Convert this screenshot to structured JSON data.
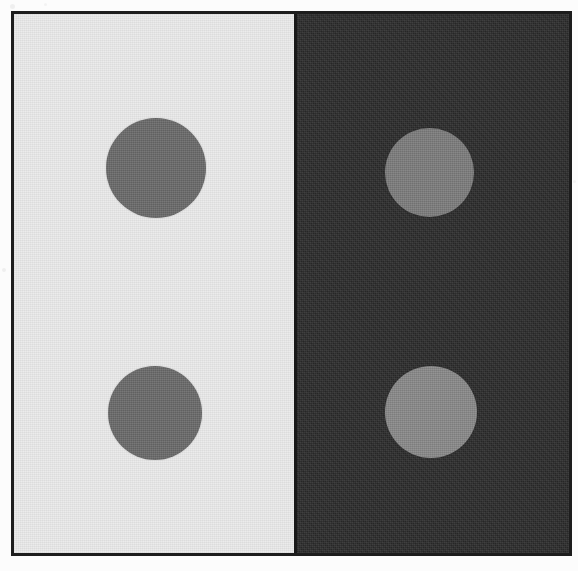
{
  "figure": {
    "kind": "simultaneous-lightness-contrast-plate",
    "width_px": 578,
    "height_px": 571
  },
  "frame": {
    "border_color": "#1d1d1d",
    "border_width_px": 3,
    "page_background": "#fcfcfc"
  },
  "panels": [
    {
      "id": "left-panel",
      "name": "light-background-panel",
      "background_color": "#ebebeb",
      "x": 0,
      "y": 0,
      "width": 282,
      "height": 539
    },
    {
      "id": "right-panel",
      "name": "dark-background-panel",
      "background_color": "#2b2b2b",
      "x": 282,
      "y": 0,
      "width": 273,
      "height": 539
    }
  ],
  "seam": {
    "color": "#181818",
    "x": 280,
    "width": 3
  },
  "disks": [
    {
      "id": "disk-top-left",
      "name": "top-left-disk",
      "panel": "light-background-panel",
      "fill_color": "#6b6b6b",
      "center_x": 142,
      "center_y": 154,
      "diameter": 100
    },
    {
      "id": "disk-top-right",
      "name": "top-right-disk",
      "panel": "dark-background-panel",
      "fill_color": "#7d7d7d",
      "center_x": 415,
      "center_y": 158,
      "diameter": 89
    },
    {
      "id": "disk-bottom-left",
      "name": "bottom-left-disk",
      "panel": "light-background-panel",
      "fill_color": "#6b6b6b",
      "center_x": 141,
      "center_y": 399,
      "diameter": 94
    },
    {
      "id": "disk-bottom-right",
      "name": "bottom-right-disk",
      "panel": "dark-background-panel",
      "fill_color": "#8a8a8a",
      "center_x": 417,
      "center_y": 398,
      "diameter": 92
    }
  ],
  "specks": [
    {
      "x": 10,
      "y": 4,
      "size": 5,
      "opacity": 0.05
    },
    {
      "x": 44,
      "y": 3,
      "size": 3,
      "opacity": 0.04
    },
    {
      "x": 2,
      "y": 268,
      "size": 4,
      "opacity": 0.05
    },
    {
      "x": 573,
      "y": 180,
      "size": 3,
      "opacity": 0.04
    }
  ]
}
